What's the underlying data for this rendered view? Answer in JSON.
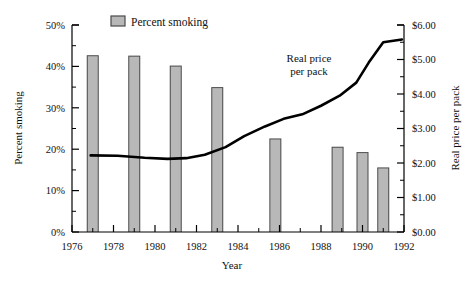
{
  "chart_data": {
    "type": "bar",
    "title": "",
    "xlabel": "Year",
    "ylabel": "Percent smoking",
    "y2label": "Real price per pack",
    "xlim": [
      1976,
      1992
    ],
    "ylim": [
      0,
      50
    ],
    "y2lim": [
      0,
      6
    ],
    "grid": false,
    "legend_position": "top-center",
    "x_tick_labels": [
      "1976",
      "1978",
      "1980",
      "1982",
      "1984",
      "1986",
      "1988",
      "1990",
      "1992"
    ],
    "x_tick_values": [
      1976,
      1978,
      1980,
      1982,
      1984,
      1986,
      1988,
      1990,
      1992
    ],
    "y_tick_labels": [
      "0%",
      "10%",
      "20%",
      "30%",
      "40%",
      "50%"
    ],
    "y_tick_values": [
      0,
      10,
      20,
      30,
      40,
      50
    ],
    "y_minor_values": [
      5,
      15,
      25,
      35,
      45
    ],
    "y2_tick_labels": [
      "$0.00",
      "$1.00",
      "$2.00",
      "$3.00",
      "$4.00",
      "$5.00",
      "$6.00"
    ],
    "y2_tick_values": [
      0,
      1,
      2,
      3,
      4,
      5,
      6
    ],
    "y2_minor_values": [
      0.5,
      1.5,
      2.5,
      3.5,
      4.5,
      5.5
    ],
    "series": [
      {
        "name": "Percent smoking",
        "type": "bar",
        "axis": "left",
        "unit": "%",
        "color": "#b8b8b8",
        "edge_color": "#4a4a4a",
        "categories": [
          1977,
          1979,
          1981,
          1983,
          1985.8,
          1988.8,
          1990,
          1991
        ],
        "values": [
          42.7,
          42.6,
          40.2,
          35.0,
          22.6,
          20.6,
          19.3,
          15.6
        ]
      },
      {
        "name": "Real price per pack",
        "type": "line",
        "axis": "right",
        "unit": "$",
        "color": "#000000",
        "x": [
          1976.9,
          1978.2,
          1979.5,
          1980.6,
          1981.5,
          1982.4,
          1983.4,
          1984.3,
          1985.3,
          1986.2,
          1987.1,
          1988.0,
          1988.9,
          1989.7,
          1990.3,
          1991.0,
          1991.9
        ],
        "values": [
          2.22,
          2.21,
          2.15,
          2.12,
          2.14,
          2.24,
          2.46,
          2.78,
          3.06,
          3.28,
          3.41,
          3.66,
          3.95,
          4.33,
          4.91,
          5.5,
          5.58
        ]
      }
    ],
    "annotations": [
      {
        "name": "real-price-per-pack-label",
        "line1": "Real price",
        "line2": "per pack",
        "x": 1986.0,
        "y2": 4.55
      }
    ],
    "legend_entries": [
      {
        "label": "Percent smoking",
        "swatch_color": "#b8b8b8",
        "swatch_edge": "#4a4a4a"
      }
    ]
  }
}
